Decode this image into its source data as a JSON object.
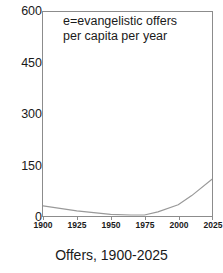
{
  "chart_data": {
    "type": "line",
    "title": "Offers, 1900-2025",
    "xlabel": "",
    "ylabel": "",
    "xlim": [
      1900,
      2025
    ],
    "ylim": [
      0,
      600
    ],
    "grid": false,
    "legend": "none",
    "annotation_lines": [
      "e=evangelistic offers",
      "per capita per year"
    ],
    "x_tick_labels": [
      "1900",
      "1925",
      "1950",
      "1975",
      "2000",
      "2025"
    ],
    "x_tick_values": [
      1900,
      1925,
      1950,
      1975,
      2000,
      2025
    ],
    "y_tick_labels": [
      "0",
      "150",
      "300",
      "450",
      "600"
    ],
    "y_tick_values": [
      0,
      150,
      300,
      450,
      600
    ],
    "series": [
      {
        "name": "e",
        "color": "#999999",
        "x": [
          1900,
          1925,
          1950,
          1965,
          1975,
          1985,
          2000,
          2010,
          2025
        ],
        "values": [
          30,
          15,
          5,
          3,
          3,
          12,
          33,
          60,
          108
        ]
      }
    ]
  },
  "caption": {
    "text": "Offers, 1900-2025"
  }
}
